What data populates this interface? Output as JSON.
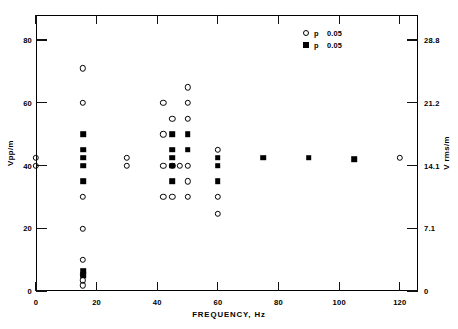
{
  "chart_data": {
    "type": "scatter",
    "title": "",
    "xlabel": "FREQUENCY, Hz",
    "ylabel": "Vpp/m",
    "ylabel_right": "V rms/m",
    "xlim": [
      0,
      126
    ],
    "ylim": [
      0,
      88
    ],
    "grid": false,
    "xticks": [
      0,
      20,
      40,
      60,
      80,
      100,
      120
    ],
    "xticklabels": [
      "0",
      "20",
      "40",
      "60",
      "80",
      "100",
      "120"
    ],
    "yticks_left": [
      0,
      20,
      40,
      60,
      80
    ],
    "yticklabels_left": [
      "0",
      "20",
      "40",
      "60",
      "80"
    ],
    "yticks_right_values": [
      0,
      20,
      40,
      60,
      80
    ],
    "yticklabels_right": [
      "0",
      "7.1",
      "14.1",
      "21.2",
      "28.8"
    ],
    "legend_position": "top-right",
    "series": [
      {
        "name": "p < 0.05",
        "marker": "open-circle",
        "points": [
          [
            0,
            42.5
          ],
          [
            0,
            40.0
          ],
          [
            15.5,
            71.0
          ],
          [
            15.5,
            60.0
          ],
          [
            15.5,
            30.0
          ],
          [
            15.5,
            19.8
          ],
          [
            15.5,
            10.0
          ],
          [
            15.5,
            5.2
          ],
          [
            15.5,
            3.4
          ],
          [
            15.5,
            1.8
          ],
          [
            30,
            42.5
          ],
          [
            30,
            40.0
          ],
          [
            42,
            60.0
          ],
          [
            42,
            50.0
          ],
          [
            42,
            40.0
          ],
          [
            42,
            30.0
          ],
          [
            45,
            55.0
          ],
          [
            45,
            40.0
          ],
          [
            45,
            30.0
          ],
          [
            47.5,
            40.0
          ],
          [
            50,
            65.0
          ],
          [
            50,
            60.0
          ],
          [
            50,
            55.0
          ],
          [
            50,
            40.0
          ],
          [
            50,
            35.0
          ],
          [
            50,
            30.0
          ],
          [
            60,
            45.0
          ],
          [
            60,
            30.0
          ],
          [
            60,
            24.7
          ],
          [
            120,
            42.5
          ]
        ]
      },
      {
        "name": "p > 0.05",
        "marker": "filled-square",
        "points": [
          [
            15.5,
            50.0
          ],
          [
            15.5,
            45.0
          ],
          [
            15.5,
            42.5
          ],
          [
            15.5,
            40.0
          ],
          [
            15.5,
            35.0
          ],
          [
            15.5,
            6.5
          ],
          [
            15.5,
            5.0
          ],
          [
            45,
            50.0
          ],
          [
            45,
            45.0
          ],
          [
            45,
            42.5
          ],
          [
            45,
            40.0
          ],
          [
            45,
            35.0
          ],
          [
            50,
            50.0
          ],
          [
            50,
            45.0
          ],
          [
            60,
            42.5
          ],
          [
            60,
            40.0
          ],
          [
            60,
            35.0
          ],
          [
            75,
            42.5
          ],
          [
            90,
            42.5
          ],
          [
            105,
            42.0
          ]
        ]
      }
    ],
    "legend": [
      {
        "symbol": "open-circle",
        "operator": "p",
        "value": "0.05"
      },
      {
        "symbol": "filled-square",
        "operator": "p",
        "value": "0.05"
      }
    ]
  }
}
